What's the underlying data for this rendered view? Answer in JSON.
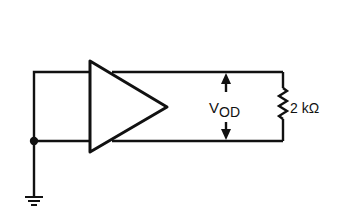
{
  "diagram": {
    "type": "circuit-schematic",
    "components": {
      "amplifier": {
        "kind": "differential-driver",
        "symbol": "triangle"
      },
      "load_resistor": {
        "kind": "resistor",
        "value_label": "2 kΩ"
      },
      "ground": {
        "kind": "ground"
      },
      "junction": {
        "kind": "node-dot"
      }
    },
    "labels": {
      "voltage_main": "V",
      "voltage_sub": "OD",
      "resistor_value": "2 kΩ"
    },
    "measurement": {
      "name": "VOD",
      "description": "differential output voltage, double-headed arrow between outputs"
    }
  }
}
